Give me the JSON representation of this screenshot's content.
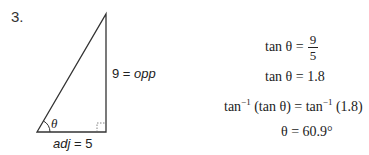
{
  "problem_number": "3.",
  "triangle": {
    "angle_label": "θ",
    "opposite_label": {
      "value": "9",
      "eq": " = ",
      "name": "opp"
    },
    "adjacent_label": {
      "name": "adj",
      "eq": " = ",
      "value": "5"
    }
  },
  "equations": [
    {
      "lhs": "tan θ =",
      "num": "9",
      "den": "5"
    },
    {
      "text": "tan θ = 1.8"
    },
    {
      "text_a": "tan",
      "sup_a": "−1",
      "text_b": " (tan θ) = tan",
      "sup_b": "−1",
      "text_c": " (1.8)"
    },
    {
      "text": "θ = 60.9°"
    }
  ]
}
